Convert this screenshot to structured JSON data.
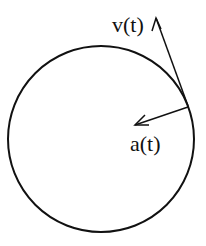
{
  "diagram": {
    "labels": {
      "velocity": "v(t)",
      "acceleration": "a(t)"
    }
  }
}
